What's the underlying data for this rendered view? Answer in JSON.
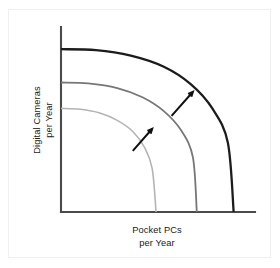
{
  "figure": {
    "title_visible": false,
    "background_color": "#ffffff",
    "frame_border_color": "#f0f0f0"
  },
  "axes": {
    "x_label_line1": "Pocket PCs",
    "x_label_line2": "per Year",
    "y_label_line1": "Digital Cameras",
    "y_label_line2": "per Year",
    "axis_color": "#4a4a4a",
    "origin_x_px": 61,
    "origin_y_px": 212,
    "x_axis_end_px": 255,
    "y_axis_top_px": 27
  },
  "annotations": {
    "arrow_count": 2,
    "arrow_color": "#111111",
    "arrow_meaning": "outward-shift"
  },
  "chart_data": {
    "type": "line",
    "title": "",
    "subtitle": "",
    "xlabel": "Pocket PCs per Year",
    "ylabel": "Digital Cameras per Year",
    "xlim": [
      0,
      1
    ],
    "ylim": [
      0,
      1
    ],
    "grid": false,
    "legend": "none",
    "tick_labels_x": [],
    "tick_labels_y": [],
    "series": [
      {
        "name": "PPF inner",
        "shape": "quarter-circle",
        "color": "#b4b4b4",
        "stroke_width": 1.6,
        "y_intercept": 0.56,
        "x_intercept": 0.49,
        "points": [
          {
            "x": 0.0,
            "y": 0.56
          },
          {
            "x": 0.1,
            "y": 0.555
          },
          {
            "x": 0.2,
            "y": 0.535
          },
          {
            "x": 0.29,
            "y": 0.495
          },
          {
            "x": 0.37,
            "y": 0.435
          },
          {
            "x": 0.43,
            "y": 0.35
          },
          {
            "x": 0.47,
            "y": 0.235
          },
          {
            "x": 0.49,
            "y": 0.0
          }
        ]
      },
      {
        "name": "PPF middle",
        "shape": "quarter-circle",
        "color": "#777777",
        "stroke_width": 1.8,
        "y_intercept": 0.7,
        "x_intercept": 0.7,
        "points": [
          {
            "x": 0.0,
            "y": 0.7
          },
          {
            "x": 0.14,
            "y": 0.695
          },
          {
            "x": 0.29,
            "y": 0.67
          },
          {
            "x": 0.42,
            "y": 0.62
          },
          {
            "x": 0.53,
            "y": 0.545
          },
          {
            "x": 0.62,
            "y": 0.44
          },
          {
            "x": 0.68,
            "y": 0.295
          },
          {
            "x": 0.7,
            "y": 0.0
          }
        ]
      },
      {
        "name": "PPF outer",
        "shape": "quarter-circle",
        "color": "#1c1c1c",
        "stroke_width": 2.3,
        "y_intercept": 0.88,
        "x_intercept": 0.89,
        "points": [
          {
            "x": 0.0,
            "y": 0.88
          },
          {
            "x": 0.18,
            "y": 0.875
          },
          {
            "x": 0.36,
            "y": 0.845
          },
          {
            "x": 0.53,
            "y": 0.785
          },
          {
            "x": 0.67,
            "y": 0.69
          },
          {
            "x": 0.78,
            "y": 0.56
          },
          {
            "x": 0.86,
            "y": 0.375
          },
          {
            "x": 0.89,
            "y": 0.0
          }
        ]
      }
    ],
    "arrows": [
      {
        "name": "shift-arrow-lower",
        "from": {
          "x": 0.37,
          "y": 0.33
        },
        "to": {
          "x": 0.47,
          "y": 0.45
        }
      },
      {
        "name": "shift-arrow-upper",
        "from": {
          "x": 0.57,
          "y": 0.52
        },
        "to": {
          "x": 0.68,
          "y": 0.65
        }
      }
    ]
  }
}
